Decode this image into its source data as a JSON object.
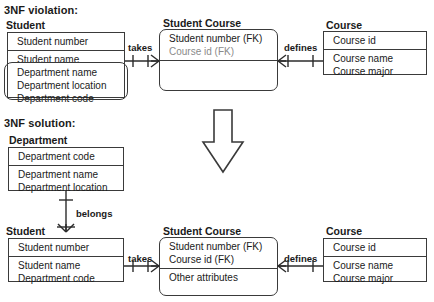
{
  "diagram": {
    "title_violation": "3NF violation:",
    "title_solution": "3NF solution:",
    "transform_arrow": "down-arrow"
  },
  "violation": {
    "student": {
      "title": "Student",
      "key_attrs": [
        "Student number"
      ],
      "normal_attrs": [
        "Student name"
      ],
      "violating_attrs": [
        "Department name",
        "Department location",
        "Department code"
      ]
    },
    "student_course": {
      "title": "Student Course",
      "key_attrs": [
        "Student number (FK)",
        "Course id (FK)"
      ],
      "other_attrs": []
    },
    "course": {
      "title": "Course",
      "key_attrs": [
        "Course id"
      ],
      "normal_attrs": [
        "Course name",
        "Course major"
      ]
    },
    "relationships": [
      {
        "label": "takes",
        "from": "Student",
        "to": "Student Course",
        "from_card": "one",
        "to_card": "many"
      },
      {
        "label": "defines",
        "from": "Student Course",
        "to": "Course",
        "from_card": "many",
        "to_card": "one"
      }
    ]
  },
  "solution": {
    "department": {
      "title": "Department",
      "key_attrs": [
        "Department code"
      ],
      "normal_attrs": [
        "Department name",
        "Department location"
      ]
    },
    "student": {
      "title": "Student",
      "key_attrs": [
        "Student number"
      ],
      "normal_attrs": [
        "Student name",
        "Department code"
      ]
    },
    "student_course": {
      "title": "Student Course",
      "key_attrs": [
        "Student number (FK)",
        "Course id (FK)"
      ],
      "other_attrs": [
        "Other attributes"
      ]
    },
    "course": {
      "title": "Course",
      "key_attrs": [
        "Course id"
      ],
      "normal_attrs": [
        "Course name",
        "Course major"
      ]
    },
    "relationships": [
      {
        "label": "belongs",
        "from": "Department",
        "to": "Student",
        "from_card": "one",
        "to_card": "many"
      },
      {
        "label": "takes",
        "from": "Student",
        "to": "Student Course",
        "from_card": "one",
        "to_card": "many"
      },
      {
        "label": "defines",
        "from": "Student Course",
        "to": "Course",
        "from_card": "many",
        "to_card": "one"
      }
    ]
  },
  "colors": {
    "line": "#2b2b2b",
    "border": "#3a3a3a",
    "text": "#1a1a1a",
    "muted_text": "#8a8a8a",
    "background": "#ffffff"
  }
}
